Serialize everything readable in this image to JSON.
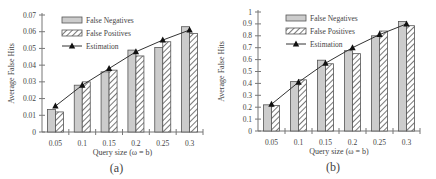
{
  "chart_data": [
    {
      "type": "bar",
      "panel_label": "(a)",
      "title": "",
      "xlabel": "Query size (ω = b)",
      "ylabel": "Average False Hits",
      "categories": [
        "0.05",
        "0.1",
        "0.15",
        "0.2",
        "0.25",
        "0.3"
      ],
      "ylim": [
        0,
        0.07
      ],
      "yticks": [
        "0",
        "0.01",
        "0.02",
        "0.03",
        "0.04",
        "0.05",
        "0.06",
        "0.07"
      ],
      "grid": false,
      "legend_position": "top-left inside",
      "series": [
        {
          "name": "False Negatives",
          "type": "bar",
          "style": "gray-fill",
          "values": [
            0.0135,
            0.028,
            0.036,
            0.049,
            0.0505,
            0.063
          ]
        },
        {
          "name": "False Positives",
          "type": "bar",
          "style": "hatched",
          "values": [
            0.012,
            0.03,
            0.037,
            0.0455,
            0.054,
            0.059
          ]
        },
        {
          "name": "Estimation",
          "type": "line",
          "marker": "triangle",
          "values": [
            0.0155,
            0.028,
            0.038,
            0.048,
            0.055,
            0.061
          ]
        }
      ]
    },
    {
      "type": "bar",
      "panel_label": "(b)",
      "title": "",
      "xlabel": "Query size (ω = b)",
      "ylabel": "Average False Hits",
      "categories": [
        "0.05",
        "0.1",
        "0.15",
        "0.2",
        "0.25",
        "0.3"
      ],
      "ylim": [
        0,
        1
      ],
      "yticks": [
        "0",
        "0.1",
        "0.2",
        "0.3",
        "0.4",
        "0.5",
        "0.6",
        "0.7",
        "0.8",
        "0.9",
        "1"
      ],
      "grid": false,
      "legend_position": "top-left inside",
      "series": [
        {
          "name": "False Negatives",
          "type": "bar",
          "style": "gray-fill",
          "values": [
            0.22,
            0.415,
            0.595,
            0.675,
            0.8,
            0.92
          ]
        },
        {
          "name": "False Positives",
          "type": "bar",
          "style": "hatched",
          "values": [
            0.215,
            0.43,
            0.565,
            0.65,
            0.84,
            0.885
          ]
        },
        {
          "name": "Estimation",
          "type": "line",
          "marker": "triangle",
          "values": [
            0.225,
            0.41,
            0.57,
            0.7,
            0.81,
            0.9
          ]
        }
      ]
    }
  ],
  "colors": {
    "bar_fill": "#cccccc",
    "bar_stroke": "#555555",
    "hatch": "#555555",
    "line": "#333333",
    "axis": "#777777"
  }
}
